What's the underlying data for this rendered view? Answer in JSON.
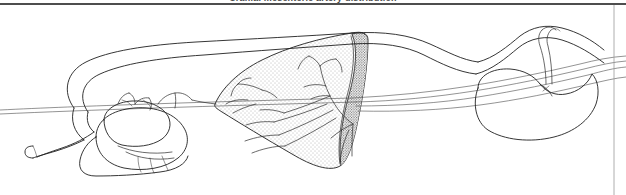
{
  "figure": {
    "caption": "Cranial mesenteric artery distribution",
    "alt_description": "Hand-drawn black and white anatomical illustration showing looped intestine, stomach, a stippled fan-shaped mesentery containing a branching arterial tree, a darker stippled crescent band, and a kidney at right.",
    "background_color": "#ffffff",
    "ink_color": "#1f1f1f",
    "rule_color": "#4e4e4e",
    "stipple_color": "#6e6e6e",
    "dense_stipple_color": "#3d3d3d"
  },
  "structures": [
    {
      "id": "intestinal-loop",
      "label": "Intestinal loop"
    },
    {
      "id": "blind-end-tube",
      "label": "Blind tube end"
    },
    {
      "id": "stomach",
      "label": "Stomach"
    },
    {
      "id": "mesentery-fan",
      "label": "Mesentery"
    },
    {
      "id": "arterial-tree",
      "label": "Arterial tree"
    },
    {
      "id": "dense-band",
      "label": "Mesenteric border band"
    },
    {
      "id": "kidney",
      "label": "Kidney"
    },
    {
      "id": "vessel-bundle",
      "label": "Vessel bundle"
    }
  ],
  "rules": {
    "top_rule": "horizontal-rule",
    "right_edge": "page-edge-line"
  }
}
